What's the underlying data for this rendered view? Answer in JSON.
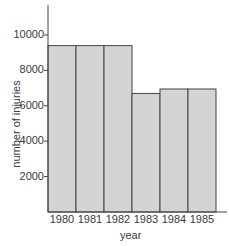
{
  "chart_data": {
    "type": "bar",
    "title": "",
    "xlabel": "year",
    "ylabel": "number of injuries",
    "categories": [
      "1980",
      "1981",
      "1982",
      "1983",
      "1984",
      "1985"
    ],
    "values": [
      9400,
      9400,
      9400,
      6700,
      6950,
      6950
    ],
    "ylim": [
      0,
      11500
    ],
    "yticks": [
      2000,
      4000,
      6000,
      8000,
      10000
    ],
    "ytick_labels": [
      "2000",
      "4000",
      "6000",
      "8000",
      "10000"
    ],
    "grid": false,
    "legend": null,
    "bar_fill": "#d4d4d4",
    "bar_edge": "#444444"
  }
}
